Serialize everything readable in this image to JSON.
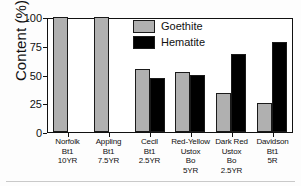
{
  "chart_data": {
    "type": "bar",
    "title": "",
    "xlabel": "",
    "ylabel": "Content (%)",
    "ylim": [
      0,
      100
    ],
    "yticks": [
      0,
      25,
      50,
      75,
      100
    ],
    "ytick_labels": [
      "0",
      "25",
      "50",
      "75",
      "100"
    ],
    "grid": false,
    "legend_position": "upper-center",
    "categories": [
      "Norfolk Bt1 10YR",
      "Appling Bt1 7.5YR",
      "Cecil Bt1 2.5YR",
      "Red-Yellow Ustox Bo 5YR",
      "Dark Red Ustox Bo 2.5YR",
      "Davidson Bt1 5R"
    ],
    "category_lines": [
      [
        "Norfolk",
        "Bt1",
        "10YR"
      ],
      [
        "Appling",
        "Bt1",
        "7.5YR"
      ],
      [
        "Cecil",
        "Bt1",
        "2.5YR"
      ],
      [
        "Red-Yellow",
        "Ustox",
        "Bo",
        "5YR"
      ],
      [
        "Dark Red",
        "Ustox",
        "Bo",
        "2.5YR"
      ],
      [
        "Davidson",
        "Bt1",
        "5R"
      ]
    ],
    "series": [
      {
        "name": "Goethite",
        "color": "#b0b0b0",
        "values": [
          100,
          100,
          55,
          52,
          34,
          25
        ]
      },
      {
        "name": "Hematite",
        "color": "#000000",
        "values": [
          0,
          0,
          47,
          50,
          68,
          78
        ]
      }
    ]
  },
  "legend": {
    "items": [
      {
        "label": "Goethite"
      },
      {
        "label": "Hematite"
      }
    ]
  },
  "axis": {
    "y_title": "Content (%)"
  }
}
